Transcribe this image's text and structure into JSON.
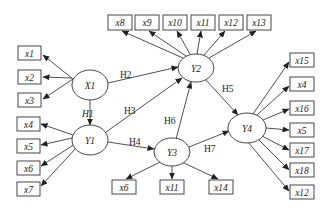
{
  "diagram": {
    "type": "structural-equation-model",
    "latent": [
      {
        "id": "X1",
        "label": "X1",
        "cx": 90,
        "cy": 85
      },
      {
        "id": "Y1",
        "label": "Y1",
        "cx": 90,
        "cy": 140
      },
      {
        "id": "Y2",
        "label": "Y2",
        "cx": 196,
        "cy": 68
      },
      {
        "id": "Y3",
        "label": "Y3",
        "cx": 172,
        "cy": 152
      },
      {
        "id": "Y4",
        "label": "Y4",
        "cx": 247,
        "cy": 128
      }
    ],
    "indicators": [
      {
        "label": "x1",
        "x": 18,
        "y": 46,
        "from": "X1"
      },
      {
        "label": "x2",
        "x": 18,
        "y": 70,
        "from": "X1"
      },
      {
        "label": "x3",
        "x": 18,
        "y": 93,
        "from": "X1"
      },
      {
        "label": "x4",
        "x": 17,
        "y": 117,
        "from": "Y1"
      },
      {
        "label": "x5",
        "x": 17,
        "y": 139,
        "from": "Y1"
      },
      {
        "label": "x6",
        "x": 17,
        "y": 161,
        "from": "Y1"
      },
      {
        "label": "x7",
        "x": 17,
        "y": 182,
        "from": "Y1"
      },
      {
        "label": "x8",
        "x": 108,
        "y": 15,
        "from": "Y2"
      },
      {
        "label": "x9",
        "x": 135,
        "y": 15,
        "from": "Y2"
      },
      {
        "label": "x10",
        "x": 163,
        "y": 15,
        "from": "Y2"
      },
      {
        "label": "x11",
        "x": 191,
        "y": 15,
        "from": "Y2"
      },
      {
        "label": "x12",
        "x": 219,
        "y": 15,
        "from": "Y2"
      },
      {
        "label": "x13",
        "x": 247,
        "y": 15,
        "from": "Y2"
      },
      {
        "label": "x6",
        "x": 112,
        "y": 180,
        "from": "Y3"
      },
      {
        "label": "x11",
        "x": 160,
        "y": 180,
        "from": "Y3"
      },
      {
        "label": "x14",
        "x": 209,
        "y": 180,
        "from": "Y3"
      },
      {
        "label": "x15",
        "x": 290,
        "y": 53,
        "from": "Y4"
      },
      {
        "label": "x4",
        "x": 290,
        "y": 77,
        "from": "Y4"
      },
      {
        "label": "x16",
        "x": 290,
        "y": 101,
        "from": "Y4"
      },
      {
        "label": "x5",
        "x": 290,
        "y": 123,
        "from": "Y4"
      },
      {
        "label": "x17",
        "x": 290,
        "y": 143,
        "from": "Y4"
      },
      {
        "label": "x18",
        "x": 290,
        "y": 163,
        "from": "Y4"
      },
      {
        "label": "x12",
        "x": 290,
        "y": 185,
        "from": "Y4"
      }
    ],
    "hypotheses": [
      {
        "label": "H1",
        "from": "X1",
        "to": "Y1"
      },
      {
        "label": "H2",
        "from": "X1",
        "to": "Y2"
      },
      {
        "label": "H3",
        "from": "Y1",
        "to": "Y2"
      },
      {
        "label": "H4",
        "from": "Y1",
        "to": "Y3"
      },
      {
        "label": "H5",
        "from": "Y2",
        "to": "Y4"
      },
      {
        "label": "H6",
        "from": "Y3",
        "to": "Y2"
      },
      {
        "label": "H7",
        "from": "Y3",
        "to": "Y4"
      }
    ]
  }
}
